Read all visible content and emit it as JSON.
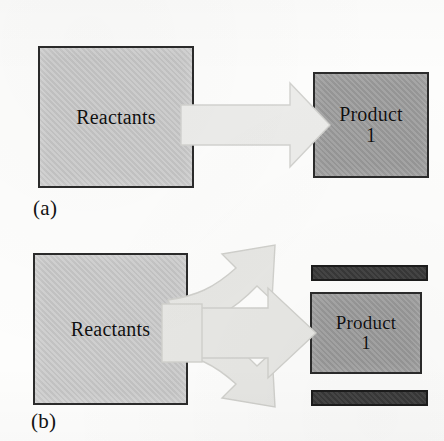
{
  "figure": {
    "type": "reaction-pathway-diagram",
    "background_color": "#fdfdfc",
    "panels": [
      {
        "caption": "(a)",
        "description": "Single reaction pathway: Reactants converted by one arrow to Product 1",
        "reactant_box": {
          "label": "Reactants",
          "fill_color": "#c6c6c6",
          "border_color": "#2b2b2b"
        },
        "product_boxes": [
          {
            "label_line1": "Product",
            "label_line2": "1",
            "fill_color": "#9a9a9a",
            "border_color": "#2b2b2b"
          }
        ],
        "arrows": [
          {
            "name": "main-arrow",
            "direction": "right",
            "fill_color": "#ececea"
          }
        ],
        "side_bars": []
      },
      {
        "caption": "(b)",
        "description": "Branching reaction pathway: Reactants split into three arrows, the middle reaching Product 1 and two others reaching unlabeled dark product bars",
        "reactant_box": {
          "label": "Reactants",
          "fill_color": "#c6c6c6",
          "border_color": "#2b2b2b"
        },
        "product_boxes": [
          {
            "label_line1": "Product",
            "label_line2": "1",
            "fill_color": "#9a9a9a",
            "border_color": "#2b2b2b"
          }
        ],
        "arrows": [
          {
            "name": "upper-branch-arrow",
            "direction": "up-right",
            "fill_color": "#e7e7e4"
          },
          {
            "name": "middle-branch-arrow",
            "direction": "right",
            "fill_color": "#e7e7e4"
          },
          {
            "name": "lower-branch-arrow",
            "direction": "down-right",
            "fill_color": "#e7e7e4"
          }
        ],
        "side_bars": [
          {
            "name": "upper-product-bar",
            "fill_color": "#3b3b3b",
            "border_color": "#1c1c1c"
          },
          {
            "name": "lower-product-bar",
            "fill_color": "#3b3b3b",
            "border_color": "#1c1c1c"
          }
        ]
      }
    ]
  }
}
